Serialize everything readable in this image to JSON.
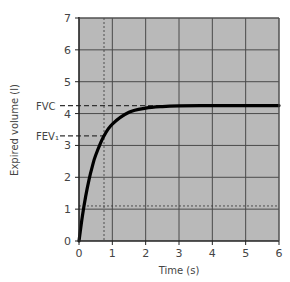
{
  "chart_data": {
    "type": "line",
    "title": "",
    "xlabel": "Time (s)",
    "ylabel": "Expired volume (l)",
    "xlim": [
      0,
      6
    ],
    "ylim": [
      0,
      7
    ],
    "x_ticks": [
      "0",
      "1",
      "2",
      "3",
      "4",
      "5",
      "6"
    ],
    "y_ticks": [
      "0",
      "1",
      "2",
      "3",
      "4",
      "5",
      "6",
      "7"
    ],
    "grid": true,
    "legend": null,
    "series": [
      {
        "name": "Expired volume",
        "x": [
          0,
          0.1,
          0.2,
          0.3,
          0.4,
          0.5,
          0.75,
          1,
          1.5,
          2,
          2.5,
          3,
          4,
          5,
          6
        ],
        "values": [
          0,
          0.77,
          1.4,
          1.92,
          2.34,
          2.69,
          3.3,
          3.67,
          4.04,
          4.17,
          4.22,
          4.24,
          4.25,
          4.25,
          4.25
        ]
      }
    ],
    "annotations": [
      {
        "label": "FVC",
        "type": "dashed-horizontal",
        "y": 4.25,
        "x_end": 3.1
      },
      {
        "label": "FEV₁",
        "type": "dashed-horizontal",
        "y": 3.3,
        "x_end": 0.75
      },
      {
        "label": "",
        "type": "dotted-vertical",
        "x": 0.75
      },
      {
        "label": "",
        "type": "dotted-horizontal",
        "y": 1.1
      }
    ],
    "colors": {
      "plot_background": "#b9b9b9",
      "grid": "#4a4a4a",
      "curve": "#000000",
      "text": "#444444"
    }
  }
}
